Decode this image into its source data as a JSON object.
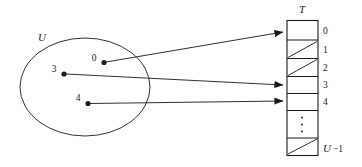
{
  "figure": {
    "type": "hash-table-direct-address-diagram",
    "universe": {
      "label": "U",
      "keys": [
        {
          "label": "0",
          "slot": 0
        },
        {
          "label": "3",
          "slot": 3
        },
        {
          "label": "4",
          "slot": 4
        }
      ]
    },
    "table": {
      "label": "T",
      "slot_labels": [
        "0",
        "1",
        "2",
        "3",
        "4"
      ],
      "ellipsis_glyph": "⋮",
      "last_slot_label_u": "U",
      "last_slot_label_suffix": "−1",
      "slots": [
        {
          "index": "0",
          "occupied": true
        },
        {
          "index": "1",
          "occupied": false
        },
        {
          "index": "2",
          "occupied": false
        },
        {
          "index": "3",
          "occupied": true
        },
        {
          "index": "4",
          "occupied": true
        },
        {
          "index": "⋮",
          "occupied": false
        },
        {
          "index": "U −1",
          "occupied": false
        }
      ]
    },
    "colors": {
      "ink": "#1a1a1a",
      "background": "#ffffff"
    }
  }
}
